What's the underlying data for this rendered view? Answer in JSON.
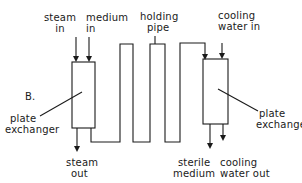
{
  "diagram": {
    "panel_label": "B.",
    "labels": {
      "steam_in": [
        "steam",
        "in"
      ],
      "medium_in": [
        "medium",
        "in"
      ],
      "holding_pipe": [
        "holding",
        "pipe"
      ],
      "cooling_water_in": [
        "cooling",
        "water in"
      ],
      "plate_exchanger_left": [
        "plate",
        "exchanger"
      ],
      "plate_exchanger_right": [
        "plate",
        "exchanger"
      ],
      "steam_out": [
        "steam",
        "out"
      ],
      "sterile_medium": [
        "sterile",
        "medium"
      ],
      "cooling_water_out": [
        "cooling",
        "water out"
      ]
    },
    "nodes": [
      "plate exchanger (heating)",
      "holding pipe",
      "plate exchanger (cooling)"
    ],
    "flows": [
      {
        "from": "steam in",
        "to": "plate exchanger (heating)"
      },
      {
        "from": "medium in",
        "to": "plate exchanger (heating)"
      },
      {
        "from": "plate exchanger (heating)",
        "to": "steam out"
      },
      {
        "from": "plate exchanger (heating)",
        "to": "holding pipe"
      },
      {
        "from": "holding pipe",
        "to": "plate exchanger (cooling)"
      },
      {
        "from": "cooling water in",
        "to": "plate exchanger (cooling)"
      },
      {
        "from": "plate exchanger (cooling)",
        "to": "sterile medium"
      },
      {
        "from": "plate exchanger (cooling)",
        "to": "cooling water out"
      }
    ],
    "colors": {
      "line": "#1a1a1a",
      "background": "#ffffff"
    }
  }
}
